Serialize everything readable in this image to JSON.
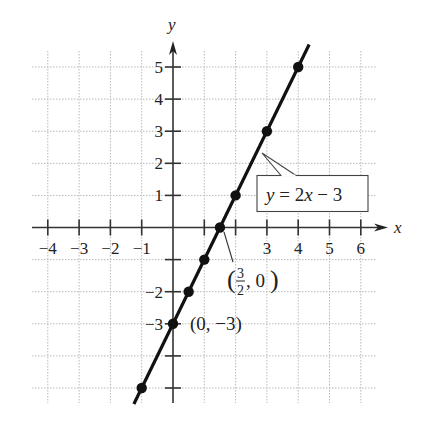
{
  "chart_data": {
    "type": "line",
    "title": "",
    "xlabel": "x",
    "ylabel": "y",
    "xlim": [
      -4,
      6
    ],
    "ylim": [
      -5,
      5
    ],
    "grid": true,
    "x_ticks": [
      -4,
      -3,
      -2,
      -1,
      1,
      2,
      3,
      4,
      5,
      6
    ],
    "x_tick_labels": [
      "−4",
      "−3",
      "−2",
      "−1",
      "",
      "",
      "3",
      "4",
      "5",
      "6"
    ],
    "y_ticks": [
      5,
      4,
      3,
      2,
      1,
      -1,
      -2,
      -3,
      -4,
      -5
    ],
    "y_tick_labels": [
      "5",
      "4",
      "3",
      "2",
      "1",
      "",
      "−2",
      "−3",
      "",
      ""
    ],
    "series": [
      {
        "name": "y = 2x − 3",
        "equation": "y = 2x - 3",
        "x": [
          -1,
          0,
          0.5,
          1,
          1.5,
          2,
          3,
          4
        ],
        "y": [
          -5,
          -3,
          -2,
          -1,
          0,
          1,
          3,
          5
        ]
      }
    ],
    "annotations": [
      {
        "text": "y = 2x − 3",
        "type": "callout-box",
        "points_to": [
          2.5,
          2
        ]
      },
      {
        "text": "(3/2, 0)",
        "type": "leader-label",
        "point": [
          1.5,
          0
        ]
      },
      {
        "text": "(0, −3)",
        "type": "label",
        "point": [
          0,
          -3
        ]
      }
    ]
  },
  "labels": {
    "x_axis": "x",
    "y_axis": "y",
    "equation_y": "y",
    "equation_rest": " = 2",
    "equation_x": "x",
    "equation_tail": " − 3",
    "xint_num": "3",
    "xint_den": "2",
    "xint_open": "(",
    "xint_rest": ", 0",
    "xint_close": ")",
    "yint": "(0, −3)"
  },
  "colors": {
    "line": "#111111",
    "axis": "#333333",
    "grid": "#b8b8b8"
  }
}
